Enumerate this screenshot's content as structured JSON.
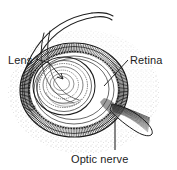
{
  "figure": {
    "kind": "anatomical-line-engraving",
    "style": "pen-and-ink stipple and hatching, grayscale",
    "background_color": "#ffffff",
    "ink_color": "#1c1c1c"
  },
  "labels": {
    "lens": "Lens",
    "retina": "Retina",
    "optic_nerve": "Optic nerve"
  },
  "leaders": {
    "lens": "arrow pointing down-right into lens center",
    "retina": "line from label down-left to retinal layer",
    "optic_nerve": "vertical line up from label to nerve trunk"
  },
  "structures": [
    "lens",
    "retina",
    "optic nerve",
    "sclera",
    "choroid",
    "ciliary body",
    "extraocular muscle bands"
  ]
}
